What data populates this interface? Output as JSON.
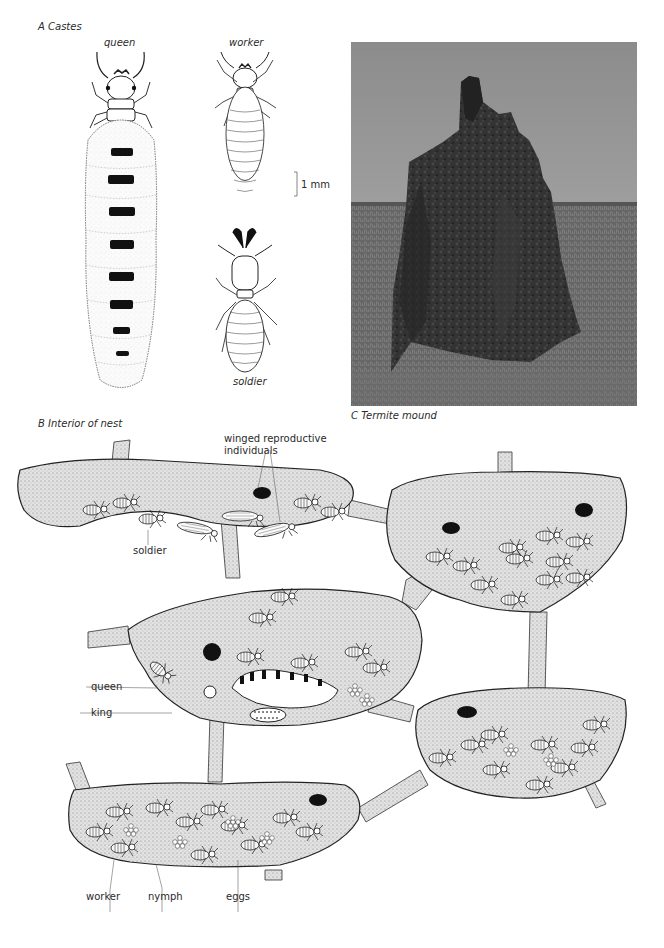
{
  "panel_a": {
    "title": "A  Castes",
    "queen_label": "queen",
    "worker_label": "worker",
    "soldier_label": "soldier",
    "scale_label": "1 mm"
  },
  "panel_b": {
    "title": "B  Interior of nest",
    "labels": {
      "winged": "winged reproductive",
      "winged2": "individuals",
      "soldier": "soldier",
      "queen": "queen",
      "king": "king",
      "worker": "worker",
      "nymph": "nymph",
      "eggs": "eggs"
    }
  },
  "panel_c": {
    "caption": "C  Termite mound"
  },
  "colors": {
    "ink": "#1a1a1a",
    "stipple": "#d9d9d9",
    "sky": "#a8a8a8",
    "mound": "#2e2e2e",
    "grass": "#6a6a6a"
  }
}
